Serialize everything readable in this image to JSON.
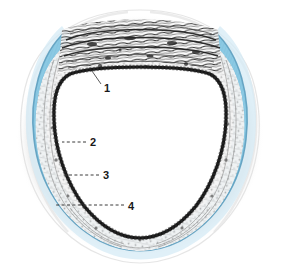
{
  "figure": {
    "background_color": "#ffffff",
    "width": 281,
    "height": 265
  },
  "colors": {
    "blue_band_fill": "#8BC9E3",
    "blue_band_fill_light": "#A8D8EC",
    "blue_band_edge": "#5E9FBF",
    "blue_band_outer_halo": "#C6E3F1",
    "lumen_fill": "#ffffff",
    "inner_boundary_dark": "#141414",
    "tissue_grey": "#9a9a9a",
    "tissue_light": "#d8d8d8",
    "label_text": "#191919",
    "leader_line": "#3a3a3a"
  },
  "labels": [
    {
      "id": "label-1",
      "number": "1",
      "text_x": 104,
      "text_y": 92,
      "leader_type": "solid",
      "leader_path": "M 101 84 L 92 71",
      "target_description": "inner dark wavy boundary of the lumen (top)"
    },
    {
      "id": "label-2",
      "number": "2",
      "text_x": 90,
      "text_y": 146,
      "leader_type": "dashed",
      "leader_path": "M 86 142 L 62 142",
      "target_description": "dark layer on the left inner wall"
    },
    {
      "id": "label-3",
      "number": "3",
      "text_x": 103,
      "text_y": 179,
      "leader_type": "dashed",
      "leader_path": "M 99 175 L 62 175",
      "target_description": "pale tissue layer between dark layer and blue band"
    },
    {
      "id": "label-4",
      "number": "4",
      "text_x": 128,
      "text_y": 210,
      "leader_type": "dashed",
      "leader_path": "M 124 205 L 54 205",
      "target_description": "outer blue-stained band (cartilage / outer coat)"
    }
  ],
  "structures": [
    {
      "name": "lumen",
      "description": "central white cavity, rounded triangular outline"
    },
    {
      "name": "inner-dark-boundary",
      "description": "thick black wavy line bordering the lumen"
    },
    {
      "name": "tissue-layer",
      "description": "mottled grey fibrous layer between lumen and blue band"
    },
    {
      "name": "fibrous-cap-top",
      "description": "dense dark horizontal fibrous bands across the top"
    },
    {
      "name": "blue-band",
      "description": "light blue stained crescent band, open at the top"
    },
    {
      "name": "outer-halo",
      "description": "faint pale grey outer tissue wisps"
    }
  ]
}
